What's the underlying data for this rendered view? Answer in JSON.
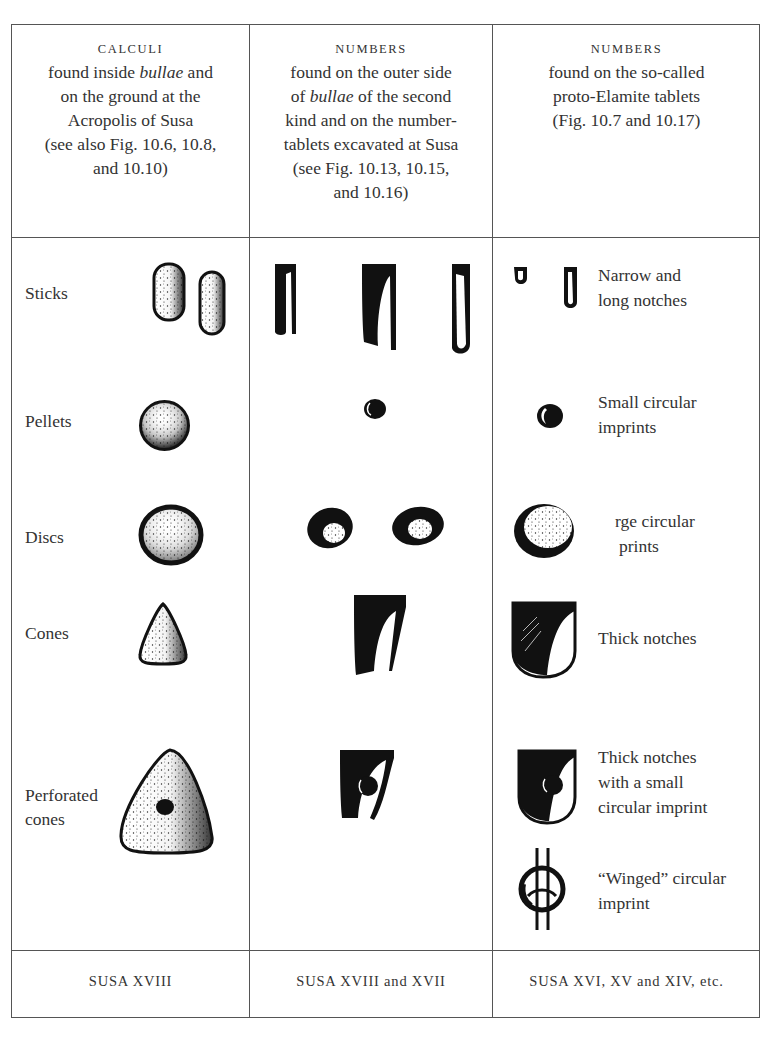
{
  "table": {
    "columns": [
      {
        "heading": "CALCULI",
        "desc_lines": [
          "found inside ",
          "bullae",
          " and",
          "on the ground at the",
          "Acropolis of Susa",
          "(see also Fig. 10.6, 10.8,",
          "and 10.10)"
        ],
        "footer": "SUSA XVIII"
      },
      {
        "heading": "NUMBERS",
        "desc_lines": [
          "found on the outer side",
          "of ",
          "bullae",
          " of the second",
          "kind and on the number-",
          "tablets excavated at Susa",
          "(see Fig. 10.13, 10.15,",
          "and 10.16)"
        ],
        "footer": "SUSA XVIII and XVII"
      },
      {
        "heading": "NUMBERS",
        "desc_lines": [
          "found on the so-called",
          "proto-Elamite tablets",
          "(Fig. 10.7 and 10.17)"
        ],
        "footer": "SUSA XVI, XV and XIV, etc."
      }
    ],
    "rows": [
      {
        "calculus": "Sticks",
        "calculus_icon": "stick-tokens-icon",
        "number_icon": "stick-numbers-icon",
        "proto_elamite_icon": "narrow-notches-icon",
        "proto_elamite_desc": [
          "Narrow and",
          "long notches"
        ]
      },
      {
        "calculus": "Pellets",
        "calculus_icon": "pellet-token-icon",
        "number_icon": "small-circle-number-icon",
        "proto_elamite_icon": "small-circular-imprint-icon",
        "proto_elamite_desc": [
          "Small circular",
          "imprints"
        ]
      },
      {
        "calculus": "Discs",
        "calculus_icon": "disc-token-icon",
        "number_icon": "disc-numbers-icon",
        "proto_elamite_icon": "large-circular-imprint-icon",
        "proto_elamite_desc": [
          "rge circular",
          "prints"
        ]
      },
      {
        "calculus": "Cones",
        "calculus_icon": "cone-token-icon",
        "number_icon": "cone-number-icon",
        "proto_elamite_icon": "thick-notch-icon",
        "proto_elamite_desc": [
          "Thick notches"
        ]
      },
      {
        "calculus": [
          "Perforated",
          "cones"
        ],
        "calculus_icon": "perforated-cone-token-icon",
        "number_icon": "perforated-cone-number-icon",
        "proto_elamite_icon": "thick-notch-with-circle-icon",
        "proto_elamite_desc": [
          "Thick notches",
          "with a small",
          "circular imprint"
        ]
      },
      {
        "calculus": "",
        "proto_elamite_icon": "winged-circular-imprint-icon",
        "proto_elamite_desc": [
          "“Winged” circular",
          "imprint"
        ]
      }
    ]
  },
  "colors": {
    "ink": "#1a1a1a",
    "text": "#333333",
    "rule": "#555555",
    "paper": "#ffffff"
  }
}
